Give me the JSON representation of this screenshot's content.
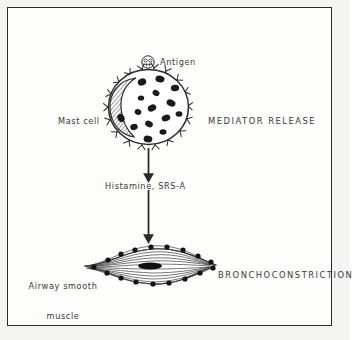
{
  "figure": {
    "background_color": "#fdfdfc",
    "border_color": "#2b2b2b",
    "ink_color": "#2b2b2b",
    "text_color": "#3a3a3a"
  },
  "labels": {
    "antigen": "Antigen",
    "mast_cell": "Mast cell",
    "mediator_release": "MEDIATOR RELEASE",
    "histamine": "Histamine, SRS-A",
    "airway_smooth_muscle_line1": "Airway smooth",
    "airway_smooth_muscle_line2": "muscle",
    "bronchoconstriction": "BRONCHOCONSTRICTION"
  },
  "diagram": {
    "type": "biological-pathway",
    "steps": [
      "Antigen binds IgE receptors on mast cell",
      "Mediator release",
      "Histamine, SRS-A",
      "Bronchoconstriction of airway smooth muscle"
    ],
    "mast_cell": {
      "center_x": 155,
      "center_y": 103,
      "radius_x": 41,
      "radius_y": 38,
      "receptor_count": 18,
      "granule_count": 14,
      "nucleus_shape": "crescent-hatched"
    },
    "antigen_particle": {
      "center_x": 147,
      "center_y": 61,
      "radius": 6
    },
    "arrows": [
      {
        "name": "mediator-release-arrow",
        "x": 155,
        "y_start": 147,
        "y_end": 178
      },
      {
        "name": "bronchoconstriction-arrow",
        "x": 155,
        "y_start": 189,
        "y_end": 240
      }
    ],
    "smooth_muscle_cell": {
      "center_x": 158,
      "center_y": 266,
      "half_width": 68,
      "half_height": 24,
      "perimeter_dot_count": 16,
      "fiber_line_count": 13,
      "nucleus_shape": "elongated-dark-oval"
    }
  }
}
